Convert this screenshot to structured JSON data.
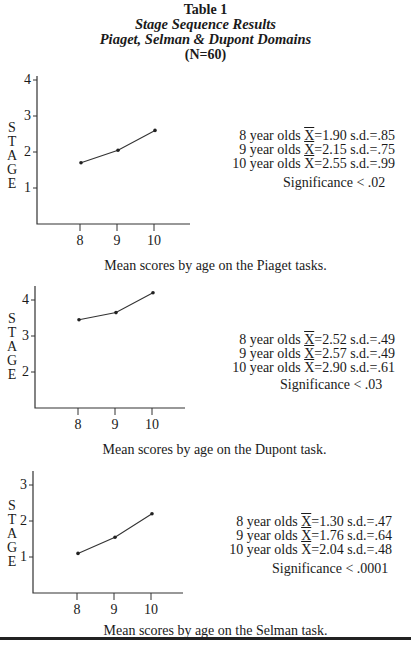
{
  "header": {
    "table_label": "Table 1",
    "subtitle": "Stage Sequence Results",
    "domains": "Piaget, Selman & Dupont Domains",
    "n": "(N=60)"
  },
  "y_axis_label_letters": [
    "S",
    "T",
    "A",
    "G",
    "E"
  ],
  "panels": [
    {
      "name": "Piaget",
      "caption": "Mean scores by age on the Piaget tasks.",
      "stats": [
        {
          "age": "8 year olds",
          "mean_symbol": "X",
          "mean": "=1.90",
          "sd": "s.d.=.85"
        },
        {
          "age": "9 year olds",
          "mean_symbol": "X",
          "mean": "=2.15",
          "sd": "s.d.=.75"
        },
        {
          "age": "10 year olds",
          "mean_symbol": "X",
          "mean": "=2.55",
          "sd": "s.d.=.99"
        }
      ],
      "significance": "Significance  <  .02"
    },
    {
      "name": "Dupont",
      "caption": "Mean scores by age on the Dupont task.",
      "stats": [
        {
          "age": "8 year olds",
          "mean_symbol": "X",
          "mean": "=2.52",
          "sd": "s.d.=.49"
        },
        {
          "age": "9 year olds",
          "mean_symbol": "X",
          "mean": "=2.57",
          "sd": "s.d.=.49"
        },
        {
          "age": "10 year olds",
          "mean_symbol": "X",
          "mean": "=2.90",
          "sd": "s.d.=.61"
        }
      ],
      "significance": "Significance  <  .03"
    },
    {
      "name": "Selman",
      "caption": "Mean scores by age on the Selman task.",
      "stats": [
        {
          "age": "8 year olds",
          "mean_symbol": "X",
          "mean": "=1.30",
          "sd": "s.d.=.47"
        },
        {
          "age": "9 year olds",
          "mean_symbol": "X",
          "mean": "=1.76",
          "sd": "s.d.=.64"
        },
        {
          "age": "10 year olds",
          "mean_symbol": "X",
          "mean": "=2.04",
          "sd": "s.d.=.48"
        }
      ],
      "significance": "Significance  <  .0001"
    }
  ],
  "chart_data": [
    {
      "type": "line",
      "title": "Mean scores by age on the Piaget tasks.",
      "xlabel": "",
      "ylabel": "STAGE",
      "categories": [
        "8",
        "9",
        "10"
      ],
      "values": [
        1.7,
        2.05,
        2.6
      ],
      "yticks": [
        "1",
        "2",
        "3",
        "4"
      ],
      "ylim": [
        0,
        4
      ],
      "grid": false,
      "legend": "none"
    },
    {
      "type": "line",
      "title": "Mean scores by age on the Dupont task.",
      "xlabel": "",
      "ylabel": "STAGE",
      "categories": [
        "8",
        "9",
        "10"
      ],
      "values": [
        3.45,
        3.65,
        4.2
      ],
      "yticks": [
        "2",
        "3",
        "4"
      ],
      "ylim": [
        1,
        4.4
      ],
      "grid": false,
      "legend": "none"
    },
    {
      "type": "line",
      "title": "Mean scores by age on the Selman task.",
      "xlabel": "",
      "ylabel": "STAGE",
      "categories": [
        "8",
        "9",
        "10"
      ],
      "values": [
        1.1,
        1.55,
        2.2
      ],
      "yticks": [
        "1",
        "2",
        "3"
      ],
      "ylim": [
        0,
        3.4
      ],
      "grid": false,
      "legend": "none"
    }
  ]
}
